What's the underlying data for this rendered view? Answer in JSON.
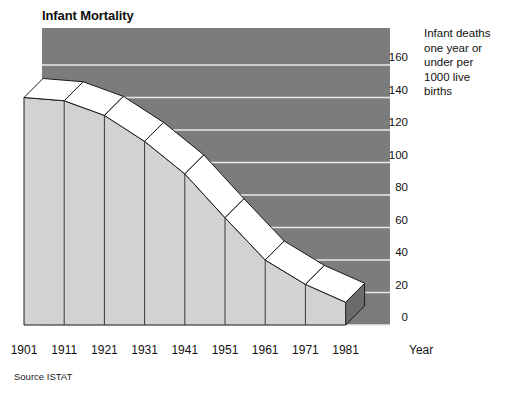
{
  "chart_data": {
    "type": "area",
    "title": "Infant Mortality",
    "xlabel": "Year",
    "ylabel": "Infant deaths one year or under per 1000 live births",
    "categories": [
      "1901",
      "1911",
      "1921",
      "1931",
      "1941",
      "1951",
      "1961",
      "1971",
      "1981"
    ],
    "values": [
      140,
      138,
      129,
      113,
      93,
      66,
      40,
      25,
      14
    ],
    "ylim": [
      0,
      160
    ],
    "yticks": [
      0,
      20,
      40,
      60,
      80,
      100,
      120,
      140,
      160
    ],
    "ytick_labels": [
      "0",
      "20",
      "40",
      "60",
      "80",
      "100",
      "120",
      "140",
      "160"
    ],
    "grid": true,
    "legend_position": "right",
    "annotations": [
      "Source ISTAT"
    ],
    "style": "3d-ribbon",
    "colors": {
      "plot_background": "#7c7c7c",
      "gridline": "#e8e8e8",
      "ribbon_top": "#ffffff",
      "ribbon_front": "#d2d2d2",
      "ribbon_side": "#6b6b6b",
      "outline": "#1a1a1a",
      "text": "#111111"
    }
  },
  "header": {
    "title": "Infant Mortality"
  },
  "axis": {
    "y_title_lines": [
      "Infant deaths",
      "one year or",
      "under per",
      "1000 live",
      "births"
    ],
    "y_title_text": "Infant deaths one year or under per 1000 live births",
    "x_title": "Year"
  },
  "footer": {
    "source": "Source ISTAT"
  }
}
